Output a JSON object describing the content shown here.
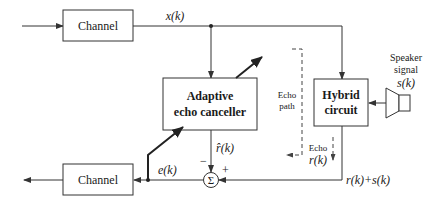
{
  "blocks": {
    "channel_top": "Channel",
    "channel_bottom": "Channel",
    "adaptive_line1": "Adaptive",
    "adaptive_line2": "echo canceller",
    "hybrid_line1": "Hybrid",
    "hybrid_line2": "circuit",
    "summer_symbol": "Σ"
  },
  "signals": {
    "x": "x(k)",
    "r_hat": "r̂(k)",
    "e": "e(k)",
    "r_plus_s": "r(k)+s(k)",
    "minus_sign": "−",
    "plus_sign": "+"
  },
  "annotations": {
    "echo_path_line1": "Echo",
    "echo_path_line2": "path",
    "echo_line1": "Echo",
    "echo_line2": "r(k)",
    "speaker_line1": "Speaker",
    "speaker_line2": "signal",
    "speaker_line3": "s(k)"
  },
  "colors": {
    "stroke": "#333333",
    "background": "#ffffff"
  }
}
